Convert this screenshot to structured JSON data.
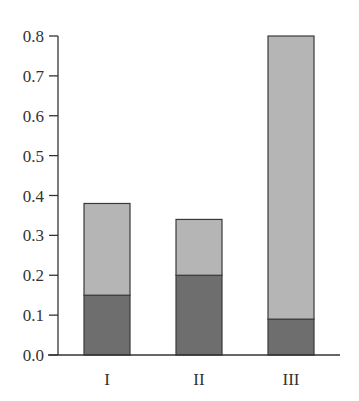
{
  "chart_data": {
    "type": "bar",
    "stacked": true,
    "title": "",
    "xlabel": "",
    "ylabel": "",
    "categories": [
      "I",
      "II",
      "III"
    ],
    "series": [
      {
        "name": "bottom",
        "color": "#6e6e6e",
        "values": [
          0.15,
          0.2,
          0.09
        ]
      },
      {
        "name": "top",
        "color": "#b5b5b5",
        "values": [
          0.23,
          0.14,
          0.71
        ]
      }
    ],
    "totals": [
      0.38,
      0.34,
      0.8
    ],
    "ylim": [
      0,
      0.8
    ],
    "yticks": [
      "0.0",
      "0.1",
      "0.2",
      "0.3",
      "0.4",
      "0.5",
      "0.6",
      "0.7",
      "0.8"
    ],
    "grid": false,
    "legend": null
  },
  "colors": {
    "axis": "#333333",
    "bar_border": "#3a3a3a"
  }
}
